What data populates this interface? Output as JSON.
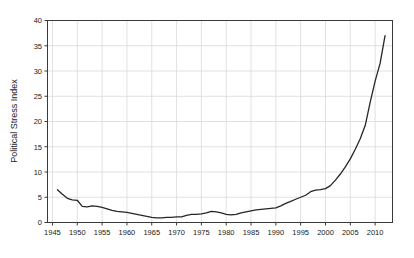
{
  "chart_data": {
    "type": "line",
    "title": "",
    "subtitle": "",
    "xlabel": "",
    "ylabel": "Political Stress Index",
    "xlim": [
      1944,
      2013.5
    ],
    "ylim": [
      0,
      40
    ],
    "grid": true,
    "legend": false,
    "legend_position": "none",
    "x_ticks": [
      1945,
      1950,
      1955,
      1960,
      1965,
      1970,
      1975,
      1980,
      1985,
      1990,
      1995,
      2000,
      2005,
      2010
    ],
    "x_tick_labels": [
      "1945",
      "1950",
      "1955",
      "1960",
      "1965",
      "1970",
      "1975",
      "1980",
      "1985",
      "1990",
      "1995",
      "2000",
      "2005",
      "2010"
    ],
    "y_ticks": [
      0,
      5,
      10,
      15,
      20,
      25,
      30,
      35,
      40
    ],
    "y_tick_labels": [
      "0",
      "5",
      "10",
      "15",
      "20",
      "25",
      "30",
      "35",
      "40"
    ],
    "series": [
      {
        "name": "Political Stress Index",
        "color": "#262626",
        "line_width": 1.3,
        "x": [
          1946,
          1947,
          1948,
          1949,
          1950,
          1951,
          1952,
          1953,
          1954,
          1955,
          1956,
          1957,
          1958,
          1959,
          1960,
          1961,
          1962,
          1963,
          1964,
          1965,
          1966,
          1967,
          1968,
          1969,
          1970,
          1971,
          1972,
          1973,
          1974,
          1975,
          1976,
          1977,
          1978,
          1979,
          1980,
          1981,
          1982,
          1983,
          1984,
          1985,
          1986,
          1987,
          1988,
          1989,
          1990,
          1991,
          1992,
          1993,
          1994,
          1995,
          1996,
          1997,
          1998,
          1999,
          2000,
          2001,
          2002,
          2003,
          2004,
          2005,
          2006,
          2007,
          2008,
          2009,
          2010,
          2011,
          2012
        ],
        "y": [
          6.5,
          5.6,
          4.8,
          4.5,
          4.4,
          3.2,
          3.1,
          3.3,
          3.2,
          3.0,
          2.7,
          2.4,
          2.2,
          2.1,
          2.0,
          1.8,
          1.6,
          1.4,
          1.2,
          1.0,
          0.9,
          0.9,
          1.0,
          1.0,
          1.1,
          1.1,
          1.4,
          1.6,
          1.6,
          1.7,
          1.9,
          2.2,
          2.1,
          1.9,
          1.6,
          1.5,
          1.6,
          1.9,
          2.1,
          2.3,
          2.5,
          2.6,
          2.7,
          2.8,
          2.9,
          3.3,
          3.8,
          4.2,
          4.6,
          5.0,
          5.4,
          6.1,
          6.4,
          6.5,
          6.7,
          7.3,
          8.4,
          9.6,
          11.0,
          12.6,
          14.5,
          16.6,
          19.2,
          23.8,
          28.0,
          31.5,
          37.0
        ]
      }
    ],
    "colors": {
      "line": "#262626",
      "grid": "#d9d9d9",
      "axis": "#3a3a3a",
      "text": "#1a1a1a",
      "background": "#ffffff"
    }
  }
}
